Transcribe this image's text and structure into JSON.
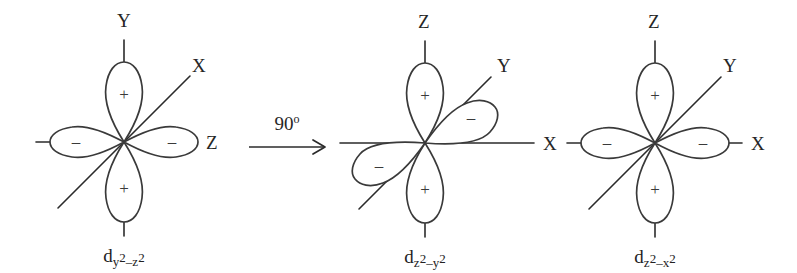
{
  "figure": {
    "background_color": "#ffffff",
    "stroke_color": "#2b2b2b",
    "width": 797,
    "height": 273
  },
  "transition": {
    "angle_text": "90",
    "degree_symbol": "o",
    "arrow_direction": "right"
  },
  "diagrams": [
    {
      "id": "orbital-1",
      "center_x": 124,
      "center_y": 142,
      "name_prefix": "d",
      "name_sub_1": "y",
      "name_sup_1": "2",
      "name_dash": "–",
      "name_sub_2": "z",
      "name_sup_2": "2",
      "name_plain": "dy2-z2",
      "vertical_axis_label": "Y",
      "horizontal_axis_label": "Z",
      "diagonal_axis_label": "X",
      "vertical_sign": "+",
      "horizontal_sign": "–",
      "diagonal_sign": "",
      "lobe_orientation": "vertical-horizontal",
      "diagonal_has_lobes": false
    },
    {
      "id": "orbital-2",
      "center_x": 425,
      "center_y": 143,
      "name_prefix": "d",
      "name_sub_1": "z",
      "name_sup_1": "2",
      "name_dash": "–",
      "name_sub_2": "y",
      "name_sup_2": "2",
      "name_plain": "dz2-y2",
      "vertical_axis_label": "Z",
      "horizontal_axis_label": "X",
      "diagonal_axis_label": "Y",
      "vertical_sign": "+",
      "horizontal_sign": "",
      "diagonal_sign": "–",
      "lobe_orientation": "vertical-diagonal",
      "diagonal_has_lobes": true
    },
    {
      "id": "orbital-3",
      "center_x": 655,
      "center_y": 143,
      "name_prefix": "d",
      "name_sub_1": "z",
      "name_sup_1": "2",
      "name_dash": "–",
      "name_sub_2": "x",
      "name_sup_2": "2",
      "name_plain": "dz2-x2",
      "vertical_axis_label": "Z",
      "horizontal_axis_label": "X",
      "diagonal_axis_label": "Y",
      "vertical_sign": "+",
      "horizontal_sign": "–",
      "diagonal_sign": "",
      "lobe_orientation": "vertical-horizontal",
      "diagonal_has_lobes": false
    }
  ]
}
